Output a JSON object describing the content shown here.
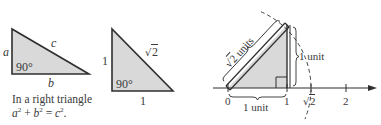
{
  "colors": {
    "fill": "#d9d9d9",
    "stroke": "#2f2f2f",
    "text": "#3a3a3a",
    "background": "#ffffff"
  },
  "triangle_general": {
    "side_a": "a",
    "side_b": "b",
    "side_c": "c",
    "angle": "90°",
    "caption_line1": "In a right triangle",
    "caption_line2_parts": {
      "a": "a",
      "a_exp": "2",
      "plus": " + ",
      "b": "b",
      "b_exp": "2",
      "eq": " = ",
      "c": "c",
      "c_exp": "2",
      "end": "."
    }
  },
  "triangle_unit": {
    "leg_vertical": "1",
    "leg_horizontal": "1",
    "hypotenuse_radicand": "2",
    "angle": "90°"
  },
  "number_line": {
    "ticks": [
      {
        "label": "0"
      },
      {
        "label": "1"
      },
      {
        "label_radicand": "2",
        "is_sqrt": true
      },
      {
        "label": "2"
      }
    ],
    "hyp_label_radicand": "2",
    "hyp_label_suffix": " units",
    "vertical_label": "1 unit",
    "base_label": "1 unit"
  }
}
